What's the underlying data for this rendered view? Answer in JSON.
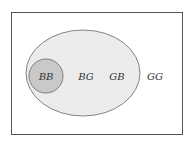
{
  "diagram": {
    "type": "venn",
    "universe": {
      "label": "",
      "fill": "#ffffff",
      "stroke": "#555555"
    },
    "outer_set": {
      "fill": "#ececec",
      "stroke": "#555555"
    },
    "inner_set": {
      "fill": "#c9c9c9",
      "stroke": "#555555"
    },
    "labels": {
      "bb": "BB",
      "bg": "BG",
      "gb": "GB",
      "gg": "GG"
    }
  }
}
